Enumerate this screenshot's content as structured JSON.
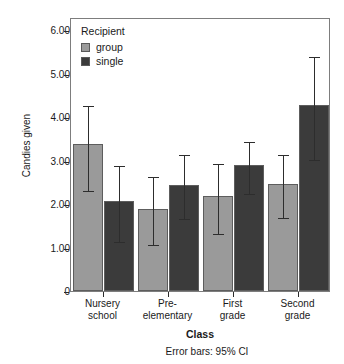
{
  "chart_data": {
    "type": "bar",
    "title": "",
    "xlabel": "Class",
    "ylabel": "Candies given",
    "categories": [
      "Nursery school",
      "Pre-elementary",
      "First grade",
      "Second grade"
    ],
    "category_lines": [
      [
        "Nursery",
        "school"
      ],
      [
        "Pre-",
        "elementary"
      ],
      [
        "First",
        "grade"
      ],
      [
        "Second",
        "grade"
      ]
    ],
    "series": [
      {
        "name": "group",
        "color": "#9a9a9a",
        "values": [
          3.37,
          1.88,
          2.18,
          2.46
        ],
        "ci_lower": [
          2.35,
          1.11,
          1.36,
          1.72
        ],
        "ci_upper": [
          4.31,
          2.66,
          2.97,
          3.18
        ]
      },
      {
        "name": "single",
        "color": "#3b3b3b",
        "values": [
          2.06,
          2.43,
          2.89,
          4.27
        ],
        "ci_lower": [
          1.17,
          1.69,
          2.27,
          3.06
        ],
        "ci_upper": [
          2.93,
          3.17,
          3.48,
          5.43
        ]
      }
    ],
    "ylim": [
      0,
      6.3
    ],
    "yticks": [
      0,
      1,
      2,
      3,
      4,
      5,
      6
    ],
    "ytick_labels": [
      "0",
      "1.00",
      "2.00",
      "3.00",
      "4.00",
      "5.00",
      "6.00"
    ],
    "grid": false,
    "legend": {
      "title": "Recipient",
      "position": "top-left-inside",
      "entries": [
        {
          "label": "group",
          "color": "#9a9a9a"
        },
        {
          "label": "single",
          "color": "#3b3b3b"
        }
      ]
    },
    "annotations": [
      "Error bars: 95% CI"
    ],
    "error_bar_note": "Error bars: 95% CI"
  }
}
